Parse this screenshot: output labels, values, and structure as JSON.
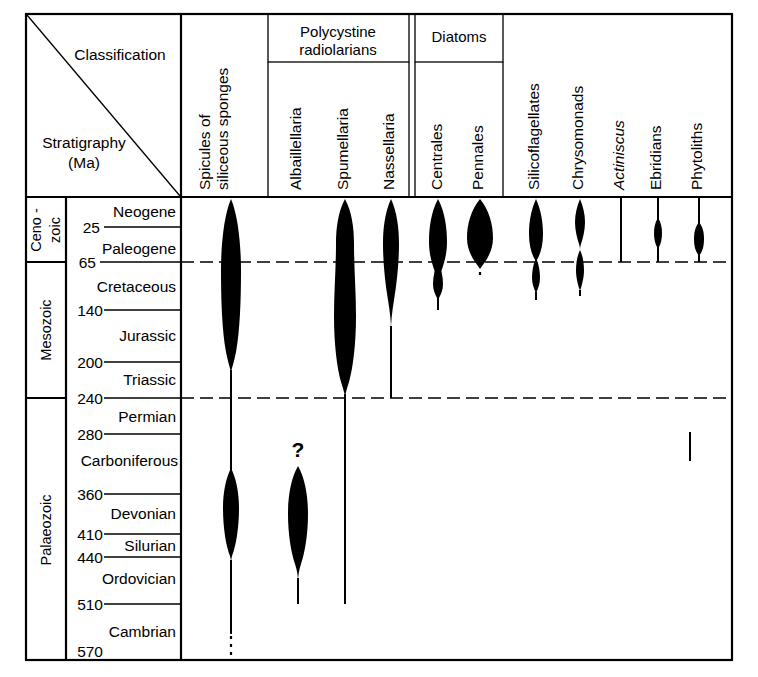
{
  "figure": {
    "corner": {
      "classification_label": "Classification",
      "stratigraphy_label": "Stratigraphy",
      "stratigraphy_unit": "(Ma)"
    },
    "group_headers": [
      {
        "name": "polycystine-radiolarians",
        "line1": "Polycystine",
        "line2": "radiolarians"
      },
      {
        "name": "diatoms",
        "line1": "Diatoms",
        "line2": ""
      }
    ],
    "taxa_headers": [
      {
        "name": "spicules-of-siliceous-sponges",
        "line1": "Spicules of",
        "line2": "siliceous sponges",
        "italic": false
      },
      {
        "name": "albaillellaria",
        "line1": "Albaillellaria",
        "line2": "",
        "italic": false
      },
      {
        "name": "spumellaria",
        "line1": "Spumellaria",
        "line2": "",
        "italic": false
      },
      {
        "name": "nassellaria",
        "line1": "Nassellaria",
        "line2": "",
        "italic": false
      },
      {
        "name": "centrales",
        "line1": "Centrales",
        "line2": "",
        "italic": false
      },
      {
        "name": "pennales",
        "line1": "Pennales",
        "line2": "",
        "italic": false
      },
      {
        "name": "silicoflagellates",
        "line1": "Silicoflagellates",
        "line2": "",
        "italic": false
      },
      {
        "name": "chrysomonads",
        "line1": "Chrysomonads",
        "line2": "",
        "italic": false
      },
      {
        "name": "actiniscus",
        "line1": "Actiniscus",
        "line2": "",
        "italic": true
      },
      {
        "name": "ebridians",
        "line1": "Ebridians",
        "line2": "",
        "italic": false
      },
      {
        "name": "phytoliths",
        "line1": "Phytoliths",
        "line2": "",
        "italic": false
      }
    ],
    "eras": [
      {
        "name": "cenozoic",
        "label_lines": [
          "Ceno -",
          "zoic"
        ]
      },
      {
        "name": "mesozoic",
        "label_lines": [
          "Mesozoic"
        ]
      },
      {
        "name": "palaeozoic",
        "label_lines": [
          "Palaeozoic"
        ]
      }
    ],
    "periods": [
      "Neogene",
      "Paleogene",
      "Cretaceous",
      "Jurassic",
      "Triassic",
      "Permian",
      "Carboniferous",
      "Devonian",
      "Silurian",
      "Ordovician",
      "Cambrian"
    ],
    "age_ticks": [
      "25",
      "65",
      "140",
      "200",
      "240",
      "280",
      "360",
      "410",
      "440",
      "510",
      "570"
    ],
    "annotations": [
      {
        "name": "albaillellaria-query",
        "text": "?"
      }
    ],
    "colors": {
      "ink": "#000000",
      "paper": "#ffffff"
    }
  },
  "chart_data": {
    "type": "range-chart",
    "xlabel": "Classification",
    "ylabel": "Stratigraphy (Ma)",
    "ylim": [
      0,
      570
    ],
    "y_axis_inverted": true,
    "grid": true,
    "legend": "none",
    "age_ticks_ma": [
      25,
      65,
      140,
      200,
      240,
      280,
      360,
      410,
      440,
      510,
      570
    ],
    "eras": [
      {
        "name": "Ceno-zoic",
        "from_ma": 0,
        "to_ma": 65
      },
      {
        "name": "Mesozoic",
        "from_ma": 65,
        "to_ma": 240
      },
      {
        "name": "Palaeozoic",
        "from_ma": 240,
        "to_ma": 570
      }
    ],
    "periods": [
      {
        "name": "Neogene",
        "from_ma": 0,
        "to_ma": 25
      },
      {
        "name": "Paleogene",
        "from_ma": 25,
        "to_ma": 65
      },
      {
        "name": "Cretaceous",
        "from_ma": 65,
        "to_ma": 140
      },
      {
        "name": "Jurassic",
        "from_ma": 140,
        "to_ma": 200
      },
      {
        "name": "Triassic",
        "from_ma": 200,
        "to_ma": 240
      },
      {
        "name": "Permian",
        "from_ma": 240,
        "to_ma": 280
      },
      {
        "name": "Carboniferous",
        "from_ma": 280,
        "to_ma": 360
      },
      {
        "name": "Devonian",
        "from_ma": 360,
        "to_ma": 410
      },
      {
        "name": "Silurian",
        "from_ma": 410,
        "to_ma": 440
      },
      {
        "name": "Ordovician",
        "from_ma": 440,
        "to_ma": 510
      },
      {
        "name": "Cambrian",
        "from_ma": 510,
        "to_ma": 570
      }
    ],
    "groups": [
      {
        "name": "Polycystine radiolarians",
        "members": [
          "Albaillellaria",
          "Spumellaria",
          "Nassellaria"
        ]
      },
      {
        "name": "Diatoms",
        "members": [
          "Centrales",
          "Pennales"
        ]
      }
    ],
    "series": [
      {
        "name": "Spicules of siliceous sponges",
        "range_top_ma": 0,
        "range_base_ma": 570,
        "base_uncertain": true,
        "abundance_profile": [
          {
            "ma": 0,
            "width": 0.3
          },
          {
            "ma": 25,
            "width": 0.85
          },
          {
            "ma": 65,
            "width": 1.0
          },
          {
            "ma": 140,
            "width": 1.0
          },
          {
            "ma": 190,
            "width": 0.55
          },
          {
            "ma": 205,
            "width": 0.1
          },
          {
            "ma": 240,
            "width": 0.06
          },
          {
            "ma": 300,
            "width": 0.06
          },
          {
            "ma": 320,
            "width": 0.55
          },
          {
            "ma": 380,
            "width": 0.75
          },
          {
            "ma": 440,
            "width": 0.25
          },
          {
            "ma": 470,
            "width": 0.06
          },
          {
            "ma": 570,
            "width": 0.06
          }
        ]
      },
      {
        "name": "Albaillellaria",
        "range_top_ma": 300,
        "range_base_ma": 510,
        "top_uncertain": true,
        "abundance_profile": [
          {
            "ma": 300,
            "width": 0.12
          },
          {
            "ma": 320,
            "width": 0.75
          },
          {
            "ma": 380,
            "width": 0.8
          },
          {
            "ma": 440,
            "width": 0.45
          },
          {
            "ma": 470,
            "width": 0.08
          },
          {
            "ma": 510,
            "width": 0.04
          }
        ]
      },
      {
        "name": "Spumellaria",
        "range_top_ma": 0,
        "range_base_ma": 510,
        "abundance_profile": [
          {
            "ma": 0,
            "width": 0.95
          },
          {
            "ma": 25,
            "width": 0.8
          },
          {
            "ma": 65,
            "width": 0.75
          },
          {
            "ma": 100,
            "width": 1.0
          },
          {
            "ma": 200,
            "width": 0.95
          },
          {
            "ma": 230,
            "width": 0.45
          },
          {
            "ma": 242,
            "width": 0.05
          },
          {
            "ma": 510,
            "width": 0.05
          }
        ]
      },
      {
        "name": "Nassellaria",
        "range_top_ma": 0,
        "range_base_ma": 240,
        "abundance_profile": [
          {
            "ma": 0,
            "width": 0.9
          },
          {
            "ma": 25,
            "width": 0.55
          },
          {
            "ma": 65,
            "width": 0.4
          },
          {
            "ma": 110,
            "width": 0.22
          },
          {
            "ma": 150,
            "width": 0.06
          },
          {
            "ma": 240,
            "width": 0.05
          }
        ]
      },
      {
        "name": "Centrales",
        "range_top_ma": 0,
        "range_base_ma": 125,
        "abundance_profile": [
          {
            "ma": 0,
            "width": 0.95
          },
          {
            "ma": 25,
            "width": 0.6
          },
          {
            "ma": 50,
            "width": 0.28
          },
          {
            "ma": 65,
            "width": 0.22
          },
          {
            "ma": 80,
            "width": 0.3
          },
          {
            "ma": 100,
            "width": 0.12
          },
          {
            "ma": 125,
            "width": 0.05
          }
        ]
      },
      {
        "name": "Pennales",
        "range_top_ma": 0,
        "range_base_ma": 72,
        "base_uncertain": true,
        "abundance_profile": [
          {
            "ma": 0,
            "width": 1.0
          },
          {
            "ma": 22,
            "width": 0.85
          },
          {
            "ma": 45,
            "width": 0.35
          },
          {
            "ma": 60,
            "width": 0.1
          },
          {
            "ma": 72,
            "width": 0.05
          }
        ]
      },
      {
        "name": "Silicoflagellates",
        "range_top_ma": 0,
        "range_base_ma": 100,
        "abundance_profile": [
          {
            "ma": 0,
            "width": 0.6
          },
          {
            "ma": 22,
            "width": 0.45
          },
          {
            "ma": 50,
            "width": 0.18
          },
          {
            "ma": 65,
            "width": 0.3
          },
          {
            "ma": 85,
            "width": 0.22
          },
          {
            "ma": 100,
            "width": 0.04
          }
        ]
      },
      {
        "name": "Chrysomonads",
        "range_top_ma": 0,
        "range_base_ma": 90,
        "abundance_profile": [
          {
            "ma": 0,
            "width": 0.35
          },
          {
            "ma": 20,
            "width": 0.35
          },
          {
            "ma": 45,
            "width": 0.1
          },
          {
            "ma": 62,
            "width": 0.3
          },
          {
            "ma": 80,
            "width": 0.15
          },
          {
            "ma": 90,
            "width": 0.04
          }
        ]
      },
      {
        "name": "Actiniscus",
        "range_top_ma": 0,
        "range_base_ma": 65,
        "abundance_profile": [
          {
            "ma": 0,
            "width": 0.05
          },
          {
            "ma": 65,
            "width": 0.05
          }
        ]
      },
      {
        "name": "Ebridians",
        "range_top_ma": 0,
        "range_base_ma": 65,
        "abundance_profile": [
          {
            "ma": 0,
            "width": 0.05
          },
          {
            "ma": 20,
            "width": 0.25
          },
          {
            "ma": 32,
            "width": 0.25
          },
          {
            "ma": 65,
            "width": 0.05
          }
        ]
      },
      {
        "name": "Phytoliths",
        "range_top_ma": 0,
        "range_base_ma": 65,
        "extra_occurrence_ma": [
          280,
          320
        ],
        "abundance_profile": [
          {
            "ma": 0,
            "width": 0.05
          },
          {
            "ma": 22,
            "width": 0.3
          },
          {
            "ma": 38,
            "width": 0.3
          },
          {
            "ma": 65,
            "width": 0.05
          }
        ]
      }
    ]
  }
}
